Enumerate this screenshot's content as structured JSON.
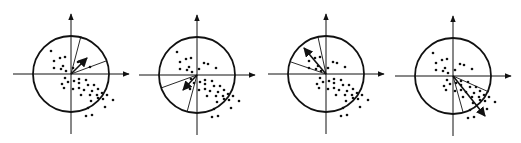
{
  "figure": {
    "width": 521,
    "height": 143,
    "colors": {
      "ink": "#111111",
      "background": "#ffffff"
    },
    "circle_radius": 38,
    "axis_extent": {
      "left": 58,
      "right": 58,
      "up": 60,
      "down": 60
    },
    "dots_relative": [
      [
        -20,
        -23
      ],
      [
        -17,
        -13
      ],
      [
        -11,
        -16
      ],
      [
        -6,
        -17
      ],
      [
        -17,
        -6
      ],
      [
        -10,
        -5
      ],
      [
        -8,
        -8
      ],
      [
        -5,
        -3
      ],
      [
        7,
        -12
      ],
      [
        11,
        -11
      ],
      [
        19,
        -7
      ],
      [
        2,
        -6
      ],
      [
        -6,
        4
      ],
      [
        -3,
        8
      ],
      [
        3,
        7
      ],
      [
        8,
        5
      ],
      [
        8,
        9
      ],
      [
        -9,
        10
      ],
      [
        -7,
        14
      ],
      [
        2,
        15
      ],
      [
        8,
        14
      ],
      [
        15,
        6
      ],
      [
        17,
        11
      ],
      [
        23,
        11
      ],
      [
        13,
        16
      ],
      [
        21,
        17
      ],
      [
        27,
        15
      ],
      [
        10,
        21
      ],
      [
        19,
        21
      ],
      [
        26,
        21
      ],
      [
        31,
        19
      ],
      [
        32,
        25
      ],
      [
        36,
        21
      ],
      [
        27,
        24
      ],
      [
        20,
        27
      ],
      [
        42,
        26
      ],
      [
        34,
        33
      ],
      [
        17,
        34
      ],
      [
        15,
        42
      ],
      [
        21,
        41
      ]
    ],
    "panels": [
      {
        "id": "panel-1",
        "origin": [
          71,
          74
        ],
        "rays": [
          [
            81,
            36
          ],
          [
            106,
            61
          ]
        ],
        "arrow": {
          "from": [
            71,
            74
          ],
          "to": [
            87,
            58
          ]
        }
      },
      {
        "id": "panel-2",
        "origin": [
          197,
          75
        ],
        "rays": [
          [
            161,
            88
          ],
          [
            187,
            112
          ]
        ],
        "arrow": {
          "from": [
            197,
            75
          ],
          "to": [
            183,
            90
          ]
        }
      },
      {
        "id": "panel-3",
        "origin": [
          326,
          74
        ],
        "rays": [
          [
            291,
            62
          ],
          [
            318,
            37
          ]
        ],
        "arrow": {
          "from": [
            326,
            74
          ],
          "to": [
            304,
            48
          ]
        }
      },
      {
        "id": "panel-4",
        "origin": [
          453,
          76
        ],
        "rays": [
          [
            489,
            92
          ],
          [
            463,
            112
          ]
        ],
        "arrow": {
          "from": [
            453,
            76
          ],
          "to": [
            485,
            116
          ]
        }
      }
    ]
  }
}
